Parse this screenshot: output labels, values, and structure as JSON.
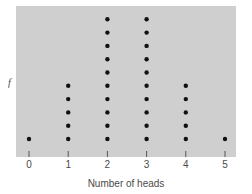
{
  "chart_data": {
    "type": "scatter",
    "subtype": "dot-plot",
    "title": "",
    "xlabel": "Number of heads",
    "ylabel": "f",
    "categories": [
      "0",
      "1",
      "2",
      "3",
      "4",
      "5"
    ],
    "values": [
      1,
      5,
      10,
      10,
      5,
      1
    ],
    "xlim": [
      0,
      5
    ],
    "ylim": [
      0,
      10
    ],
    "grid": false,
    "legend": "none",
    "colors": {
      "panel": "#cfcfcf",
      "dot": "#111111",
      "tick": "#555555",
      "text": "#4a4a4a"
    }
  }
}
